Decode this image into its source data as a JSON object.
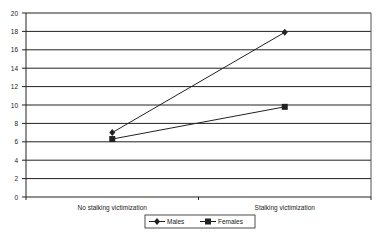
{
  "chart_data": {
    "type": "line",
    "title": "",
    "xlabel": "",
    "ylabel": "",
    "categories": [
      "No stalking victimization",
      "Stalking victimization"
    ],
    "series": [
      {
        "name": "Males",
        "marker": "diamond",
        "values": [
          7.0,
          17.9
        ]
      },
      {
        "name": "Females",
        "marker": "square",
        "values": [
          6.3,
          9.8
        ]
      }
    ],
    "ylim": [
      0,
      20
    ],
    "yticks": [
      0,
      2,
      4,
      6,
      8,
      10,
      12,
      14,
      16,
      18,
      20
    ],
    "grid": true,
    "legend_position": "bottom"
  },
  "colors": {
    "line": "#222222",
    "grid": "#222222",
    "background": "#ffffff"
  }
}
